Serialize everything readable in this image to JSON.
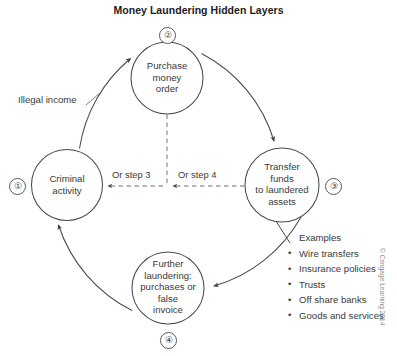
{
  "title": "Money Laundering Hidden Layers",
  "nodes": [
    {
      "id": "criminal-activity",
      "badge": "①",
      "lines": [
        "Criminal",
        "activity"
      ]
    },
    {
      "id": "purchase-money-order",
      "badge": "②",
      "lines": [
        "Purchase",
        "money",
        "order"
      ]
    },
    {
      "id": "transfer-funds",
      "badge": "③",
      "lines": [
        "Transfer",
        "funds",
        "to laundered",
        "assets"
      ]
    },
    {
      "id": "further-laundering",
      "badge": "④",
      "lines": [
        "Further",
        "laundering:",
        "purchases or",
        "false",
        "invoice"
      ]
    }
  ],
  "edge_labels": {
    "illegal_income": "Illegal income",
    "or_step_3": "Or step 3",
    "or_step_4": "Or step 4"
  },
  "examples": {
    "heading": "Examples",
    "items": [
      "Wire transfers",
      "Insurance policies",
      "Trusts",
      "Off share banks",
      "Goods and services"
    ]
  },
  "copyright": "© Cengage Learning 2014",
  "colors": {
    "stroke": "#4a4a4a",
    "text": "#3a3a3a",
    "title": "#1c1c1c",
    "dashed": "#7a7a7a",
    "copyright": "#8d8d8d"
  }
}
